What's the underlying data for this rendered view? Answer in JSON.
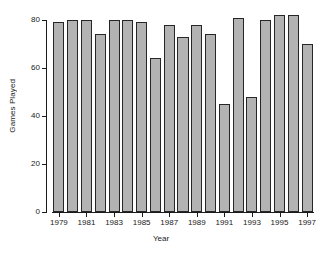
{
  "chart_data": {
    "type": "bar",
    "title": "",
    "xlabel": "Year",
    "ylabel": "Games Played",
    "categories": [
      "1979",
      "1980",
      "1981",
      "1982",
      "1983",
      "1984",
      "1985",
      "1986",
      "1987",
      "1988",
      "1989",
      "1990",
      "1991",
      "1992",
      "1993",
      "1994",
      "1995",
      "1996",
      "1997"
    ],
    "values": [
      79,
      80,
      80,
      74,
      80,
      80,
      79,
      64,
      78,
      73,
      78,
      74,
      45,
      81,
      48,
      80,
      82,
      82,
      70
    ],
    "ylim": [
      0,
      80
    ],
    "xlim_note": "19 bars, one per year 1979-1997",
    "yticks": [
      0,
      20,
      40,
      60,
      80
    ],
    "ytick_labels": [
      "0",
      "20",
      "40",
      "60",
      "80"
    ],
    "xtick_labels": [
      "1979",
      "1981",
      "1983",
      "1985",
      "1987",
      "1989",
      "1991",
      "1993",
      "1995",
      "1997"
    ],
    "xtick_categories": [
      "1979",
      "1981",
      "1983",
      "1985",
      "1987",
      "1989",
      "1991",
      "1993",
      "1995",
      "1997"
    ],
    "grid": false,
    "legend": false,
    "legend_position": "none",
    "bar_fill_color": "#b3b3b3",
    "bar_border_color": "#262626",
    "axis_color": "#1a1a1a",
    "background_color": "#ffffff"
  }
}
